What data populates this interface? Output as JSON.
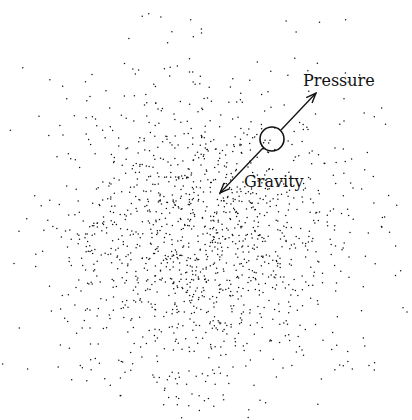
{
  "diagram": {
    "width": 412,
    "height": 420,
    "background": "#ffffff",
    "ink": "#111111",
    "labels": {
      "pressure": "Pressure",
      "gravity": "Gravity"
    },
    "parcel": {
      "cx": 272,
      "cy": 139,
      "r": 12
    },
    "pressure_arrow": {
      "x1": 281,
      "y1": 130,
      "x2": 316,
      "y2": 93
    },
    "gravity_arrow": {
      "x1": 263,
      "y1": 148,
      "x2": 220,
      "y2": 193
    },
    "pressure_label_pos": {
      "x": 303,
      "y": 86
    },
    "gravity_label_pos": {
      "x": 244,
      "y": 187
    },
    "cloud": {
      "center_x": 205,
      "center_y": 235,
      "sigma": 78,
      "dot_count": 1500,
      "dot_radius": 0.75,
      "seed": 7
    }
  }
}
